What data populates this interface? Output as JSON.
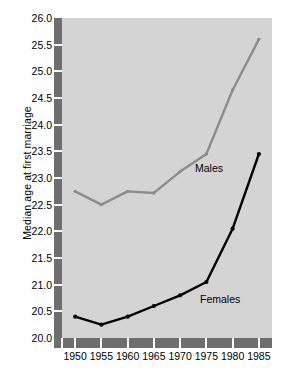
{
  "chart_data": {
    "type": "line",
    "title": "",
    "xlabel": "",
    "ylabel": "Median age at first marriage",
    "x": [
      1950,
      1955,
      1960,
      1965,
      1970,
      1975,
      1980,
      1985
    ],
    "xticklabels": [
      "1950",
      "1955",
      "1960",
      "1965",
      "1970",
      "1975",
      "1980",
      "1985"
    ],
    "xlim": [
      1947.5,
      1987.5
    ],
    "ylim": [
      20.0,
      26.0
    ],
    "yticks": [
      20.0,
      20.5,
      21.0,
      21.5,
      22.0,
      22.5,
      23.0,
      23.5,
      24.0,
      24.5,
      25.0,
      25.5,
      26.0
    ],
    "yticklabels": [
      "20.0",
      "20.5",
      "21.0",
      "21.5",
      "22.0",
      "22.5",
      "23.0",
      "23.5",
      "24.0",
      "24.5",
      "25.0",
      "25.5",
      "26.0"
    ],
    "grid": false,
    "legend_position": "inline-annotations",
    "series": [
      {
        "name": "Males",
        "color": "#8c8c8c",
        "label_text": "Males",
        "values": [
          22.75,
          22.5,
          22.75,
          22.72,
          23.12,
          23.45,
          24.65,
          25.6
        ]
      },
      {
        "name": "Females",
        "color": "#000000",
        "label_text": "Females",
        "values": [
          20.4,
          20.25,
          20.4,
          20.6,
          20.8,
          21.05,
          22.05,
          23.45
        ]
      }
    ],
    "annotations": [
      {
        "text": "Males",
        "x": 1971,
        "y": 23.1
      },
      {
        "text": "Females",
        "x": 1972,
        "y": 20.75
      }
    ],
    "colors": {
      "plot_background": "#d4d4d4",
      "page_background": "#ffffff",
      "axis_band": "#6e6e6e",
      "tick_mark": "#ffffff",
      "males_line": "#8c8c8c",
      "females_line": "#000000"
    }
  }
}
